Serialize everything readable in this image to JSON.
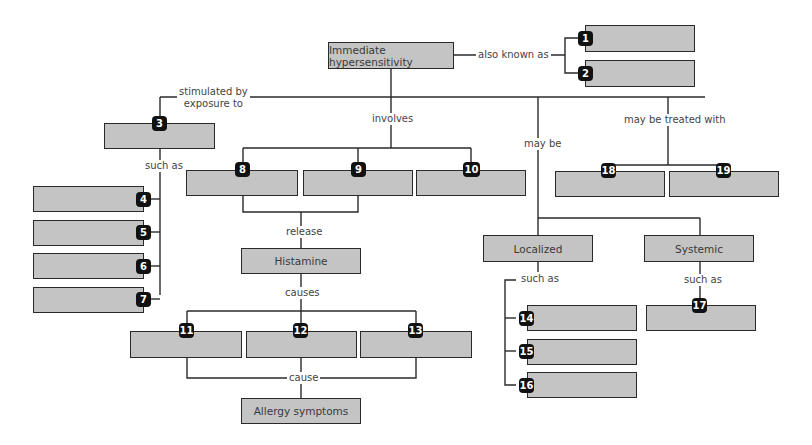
{
  "diagram": {
    "type": "concept-map",
    "root": {
      "label": "Immediate hypersensitivity"
    },
    "nodes": {
      "histamine": "Histamine",
      "allergy_symptoms": "Allergy symptoms",
      "localized": "Localized",
      "systemic": "Systemic"
    },
    "blank_boxes": [
      "1",
      "2",
      "3",
      "4",
      "5",
      "6",
      "7",
      "8",
      "9",
      "10",
      "11",
      "12",
      "13",
      "14",
      "15",
      "16",
      "17",
      "18",
      "19"
    ],
    "links": {
      "also_known_as": "also known as",
      "stimulated_by_line1": "stimulated by",
      "stimulated_by_line2": "exposure to",
      "involves": "involves",
      "may_be": "may be",
      "may_be_treated_with": "may be treated with",
      "such_as_left": "such as",
      "release": "release",
      "causes": "causes",
      "cause": "cause",
      "such_as_localized": "such as",
      "such_as_systemic": "such as"
    },
    "colors": {
      "box_fill": "#c4c4c4",
      "box_border": "#2a2a2a",
      "badge": "#111111",
      "line": "#2a2a2a"
    }
  }
}
